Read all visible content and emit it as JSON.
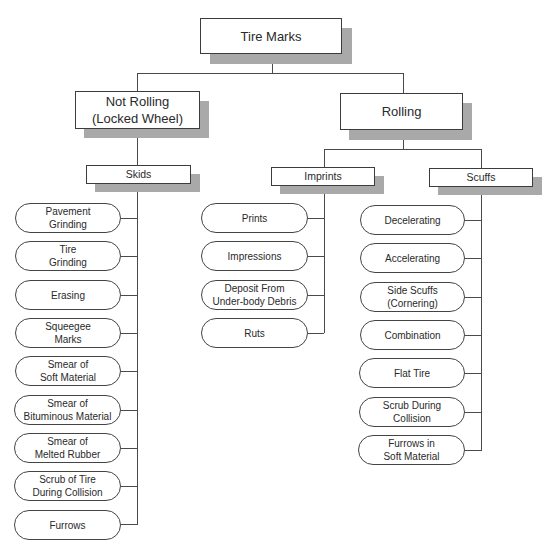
{
  "diagram": {
    "title": "Tire Marks",
    "branches": [
      {
        "label": "Not Rolling\n(Locked Wheel)",
        "groups": [
          {
            "label": "Skids",
            "items": [
              "Pavement\nGrinding",
              "Tire\nGrinding",
              "Erasing",
              "Squeegee\nMarks",
              "Smear of\nSoft Material",
              "Smear of\nBituminous Material",
              "Smear of\nMelted Rubber",
              "Scrub of Tire\nDuring Collision",
              "Furrows"
            ]
          }
        ]
      },
      {
        "label": "Rolling",
        "groups": [
          {
            "label": "Imprints",
            "items": [
              "Prints",
              "Impressions",
              "Deposit From\nUnder-body Debris",
              "Ruts"
            ]
          },
          {
            "label": "Scuffs",
            "items": [
              "Decelerating",
              "Accelerating",
              "Side Scuffs\n(Cornering)",
              "Combination",
              "Flat Tire",
              "Scrub During\nCollision",
              "Furrows in\nSoft Material"
            ]
          }
        ]
      }
    ]
  },
  "colors": {
    "line": "#4a4a4a",
    "shadow": "#a9a9a9",
    "box_border": "#3c3c3c",
    "background": "#ffffff"
  }
}
